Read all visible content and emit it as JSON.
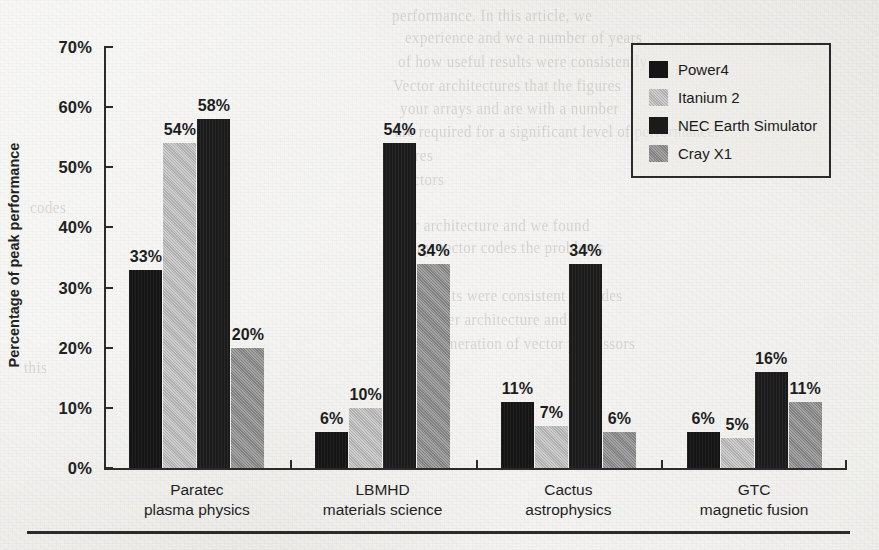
{
  "page": {
    "background_color": "#e9e9e6",
    "ghost_text": [
      {
        "text": "performance. In this article, we",
        "x": 392,
        "y": 8
      },
      {
        "text": "experience and we a number of years",
        "x": 405,
        "y": 30
      },
      {
        "text": "of how useful results were consistently",
        "x": 398,
        "y": 54
      },
      {
        "text": "Vector architectures that the figures",
        "x": 393,
        "y": 78
      },
      {
        "text": "your arrays and are with a number",
        "x": 400,
        "y": 101
      },
      {
        "text": "are required for a significant level of performance.",
        "x": 395,
        "y": 124
      },
      {
        "text": "tures",
        "x": 402,
        "y": 148
      },
      {
        "text": "vectors",
        "x": 398,
        "y": 172
      },
      {
        "text": "their architecture and we found",
        "x": 390,
        "y": 218
      },
      {
        "text": "Many vector codes the problems",
        "x": 396,
        "y": 240
      },
      {
        "text": "The results were consistent in codes",
        "x": 392,
        "y": 288
      },
      {
        "text": "the newer architecture and the",
        "x": 398,
        "y": 312
      },
      {
        "text": "A new generation of vector processors",
        "x": 390,
        "y": 336
      },
      {
        "text": "codes",
        "x": 30,
        "y": 200
      },
      {
        "text": "this",
        "x": 24,
        "y": 360
      }
    ]
  },
  "chart_data": {
    "type": "bar",
    "title": "",
    "xlabel": "",
    "ylabel": "Percentage of peak performance",
    "ylim": [
      0,
      70
    ],
    "ytick_labels": [
      "70%",
      "60%",
      "50%",
      "40%",
      "30%",
      "20%",
      "10%",
      "0%"
    ],
    "yticks": [
      70,
      60,
      50,
      40,
      30,
      20,
      10,
      0
    ],
    "grid": false,
    "legend_position": "upper-right",
    "value_suffix": "%",
    "categories": [
      "Paratec",
      "LBMHD",
      "Cactus",
      "GTC"
    ],
    "category_sublabels": [
      "plasma physics",
      "materials science",
      "astrophysics",
      "magnetic fusion"
    ],
    "series": [
      {
        "name": "Power4",
        "color": "#151515",
        "values": [
          33,
          6,
          11,
          6
        ]
      },
      {
        "name": "Itanium 2",
        "color": "#b9b9b9",
        "values": [
          54,
          10,
          7,
          5
        ]
      },
      {
        "name": "NEC Earth Simulator",
        "color": "#1b1b1b",
        "values": [
          58,
          54,
          34,
          16
        ]
      },
      {
        "name": "Cray X1",
        "color": "#8b8b8b",
        "values": [
          20,
          34,
          6,
          11
        ]
      }
    ],
    "bar_labels": [
      [
        "33%",
        "54%",
        "58%",
        "20%"
      ],
      [
        "6%",
        "10%",
        "54%",
        "34%"
      ],
      [
        "11%",
        "7%",
        "34%",
        "6%"
      ],
      [
        "6%",
        "5%",
        "16%",
        "11%"
      ]
    ]
  }
}
